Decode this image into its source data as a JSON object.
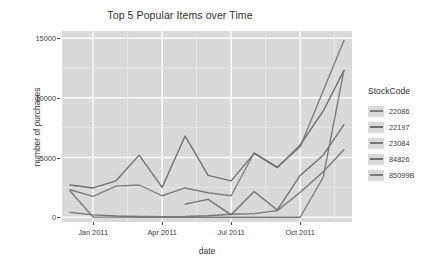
{
  "chart_data": {
    "type": "line",
    "title": "Top 5 Popular Items over Time",
    "xlabel": "date",
    "ylabel": "number of purchases",
    "ylim": [
      -400,
      15600
    ],
    "xlim": [
      0,
      12.6
    ],
    "grid": true,
    "legend_position": "right",
    "legend_title": "StockCode",
    "xticks": [
      {
        "value": 1.35,
        "label": "Jan 2011"
      },
      {
        "value": 4.35,
        "label": "Apr 2011"
      },
      {
        "value": 7.35,
        "label": "Jul 2011"
      },
      {
        "value": 10.35,
        "label": "Oct 2011"
      }
    ],
    "yticks": [
      {
        "value": 0,
        "label": "0"
      },
      {
        "value": 5000,
        "label": "5000"
      },
      {
        "value": 10000,
        "label": "10000"
      },
      {
        "value": 15000,
        "label": "15000"
      }
    ],
    "series": [
      {
        "name": "22086",
        "color": "#7d7d7d",
        "x": [
          0.35,
          1.35,
          2.35,
          3.35,
          4.35,
          5.35,
          6.35,
          7.35,
          8.35,
          9.35,
          10.35,
          11.35,
          12.25
        ],
        "values": [
          2300,
          1750,
          2600,
          2700,
          1800,
          2450,
          2050,
          1800,
          5400,
          4200,
          5900,
          10600,
          14800
        ]
      },
      {
        "name": "22197",
        "color": "#6f6f6f",
        "x": [
          0.35,
          1.35,
          2.35,
          3.35,
          4.35,
          5.35,
          6.35,
          7.35,
          8.35,
          9.35,
          10.35,
          11.35,
          12.25
        ],
        "values": [
          2700,
          2450,
          3050,
          5200,
          2500,
          6800,
          3500,
          3050,
          5350,
          4150,
          6050,
          8900,
          12300
        ]
      },
      {
        "name": "23084",
        "color": "#767676",
        "x": [
          0.35,
          1.35,
          2.35,
          3.35,
          4.35,
          5.35,
          6.35,
          7.35,
          8.35,
          9.35,
          10.35,
          11.35,
          12.25
        ],
        "values": [
          400,
          200,
          100,
          60,
          50,
          60,
          120,
          250,
          300,
          550,
          2100,
          3800,
          5650
        ]
      },
      {
        "name": "84826",
        "color": "#707070",
        "x": [
          5.35,
          6.35,
          7.35,
          8.35,
          9.35,
          10.35,
          11.35,
          12.25
        ],
        "values": [
          1100,
          1500,
          200,
          2150,
          600,
          3500,
          5200,
          7750
        ]
      },
      {
        "name": "85099B",
        "color": "#7a7a7a",
        "x": [
          0.35,
          1.35,
          2.35,
          3.35,
          4.35,
          5.35,
          6.35,
          7.35,
          8.35,
          9.35,
          10.35,
          11.35,
          12.25
        ],
        "values": [
          2200,
          20,
          10,
          0,
          0,
          0,
          0,
          0,
          0,
          0,
          0,
          3350,
          12300
        ]
      }
    ]
  }
}
